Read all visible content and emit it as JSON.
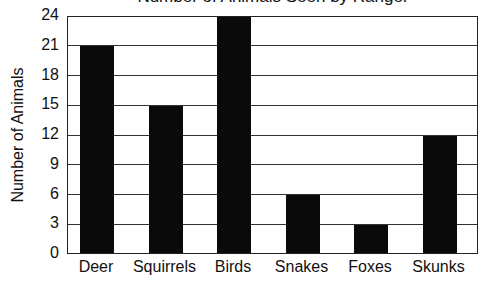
{
  "chart_data": {
    "type": "bar",
    "title": "Number of Animals Seen by Ranger",
    "xlabel": "",
    "ylabel": "Number of Animals",
    "categories": [
      "Deer",
      "Squirrels",
      "Birds",
      "Snakes",
      "Foxes",
      "Skunks"
    ],
    "values": [
      21,
      15,
      24,
      6,
      3,
      12
    ],
    "ylim": [
      0,
      24
    ],
    "yticks": [
      0,
      3,
      6,
      9,
      12,
      15,
      18,
      21,
      24
    ],
    "grid": true,
    "legend": null,
    "bar_color": "#0a0a0a"
  }
}
